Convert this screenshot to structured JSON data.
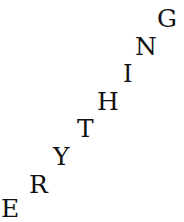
{
  "canvas": {
    "width": 184,
    "height": 222,
    "background_color": "#ffffff",
    "text_color": "#111111"
  },
  "artwork": {
    "name": "diagonal-letter-arrangement",
    "word": "EVERYTHING",
    "visible_text": "ERYTHING",
    "description": "Eight capital serif letters arranged along an ascending diagonal from bottom-left to top-right",
    "direction": "bottom-left to top-right"
  },
  "letters": [
    {
      "char": "E",
      "x": 1,
      "baseline": 221,
      "size": 25
    },
    {
      "char": "R",
      "x": 29,
      "baseline": 197,
      "size": 25
    },
    {
      "char": "Y",
      "x": 53,
      "baseline": 169,
      "size": 25
    },
    {
      "char": "T",
      "x": 77,
      "baseline": 141,
      "size": 25
    },
    {
      "char": "H",
      "x": 97,
      "baseline": 114,
      "size": 25
    },
    {
      "char": "I",
      "x": 123,
      "baseline": 86,
      "size": 24
    },
    {
      "char": "N",
      "x": 135,
      "baseline": 59,
      "size": 25
    },
    {
      "char": "G",
      "x": 157,
      "baseline": 31,
      "size": 25
    }
  ]
}
